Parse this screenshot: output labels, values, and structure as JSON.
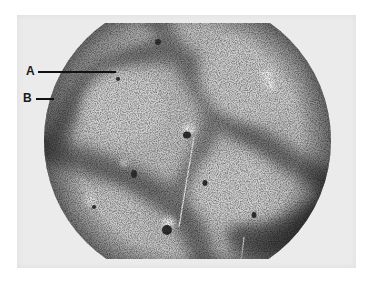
{
  "figure": {
    "type": "photomicrograph",
    "labels": [
      {
        "id": "A",
        "text": "A",
        "points_to": "lighter central zone of lobule"
      },
      {
        "id": "B",
        "text": "B",
        "points_to": "darker peripheral band"
      }
    ],
    "colors": {
      "background": "#ffffff",
      "plate": "#ebebeb",
      "light_zone": "#c9c9c9",
      "dark_band": "#6e6e6e",
      "label_ink": "#1a1a1a"
    }
  }
}
